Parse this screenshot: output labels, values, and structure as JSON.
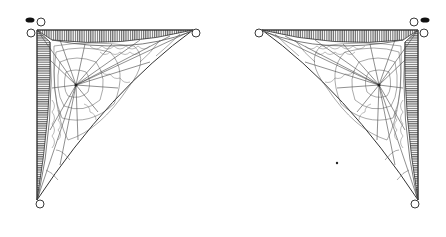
{
  "artwork": {
    "description": "Pair of mirrored spider-web corner ornaments",
    "colors": {
      "background": "#ffffff",
      "ink": "#222222",
      "hatch": "#555555",
      "web": "#444444"
    },
    "ornaments": [
      {
        "id": "left",
        "corner": [
          37,
          30
        ],
        "top_end": [
          193,
          30
        ],
        "bottom_end": [
          37,
          200
        ],
        "web_center": [
          76,
          85
        ]
      },
      {
        "id": "right",
        "corner": [
          418,
          30
        ],
        "top_end": [
          260,
          32
        ],
        "bottom_end": [
          418,
          200
        ],
        "web_center": [
          379,
          85
        ]
      }
    ],
    "bugs": [
      {
        "x": 29,
        "y": 20
      },
      {
        "x": 420,
        "y": 20
      }
    ],
    "dot": {
      "x": 337,
      "y": 163
    }
  }
}
